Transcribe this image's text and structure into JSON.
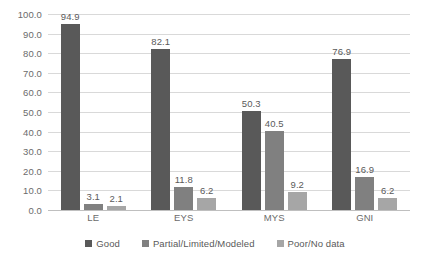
{
  "chart_data": {
    "type": "bar",
    "title": "",
    "subtitle": "",
    "xlabel": "",
    "ylabel": "",
    "categories": [
      "LE",
      "EYS",
      "MYS",
      "GNI"
    ],
    "series": [
      {
        "name": "Good",
        "color": "#595959",
        "values": [
          94.9,
          82.1,
          50.3,
          76.9
        ]
      },
      {
        "name": "Partial/Limited/Modeled",
        "color": "#808080",
        "values": [
          3.1,
          11.8,
          40.5,
          16.9
        ]
      },
      {
        "name": "Poor/No data",
        "color": "#a6a6a6",
        "values": [
          2.1,
          6.2,
          9.2,
          6.2
        ]
      }
    ],
    "ylim": [
      0.0,
      100.0
    ],
    "ytick_step": 10.0,
    "ytick_labels": [
      "100.0",
      "90.0",
      "80.0",
      "70.0",
      "60.0",
      "50.0",
      "40.0",
      "30.0",
      "20.0",
      "10.0",
      "0.0"
    ],
    "ytick_values": [
      100.0,
      90.0,
      80.0,
      70.0,
      60.0,
      50.0,
      40.0,
      30.0,
      20.0,
      10.0,
      0.0
    ],
    "data_labels": [
      [
        "94.9",
        "3.1",
        "2.1"
      ],
      [
        "82.1",
        "11.8",
        "6.2"
      ],
      [
        "50.3",
        "40.5",
        "9.2"
      ],
      [
        "76.9",
        "16.9",
        "6.2"
      ]
    ],
    "grid": true,
    "legend_position": "bottom",
    "legend": [
      "Good",
      "Partial/Limited/Modeled",
      "Poor/No data"
    ],
    "background_color": "#ffffff",
    "gridline_color": "#d9d9d9",
    "axis_text_color": "#6b6b6b"
  }
}
